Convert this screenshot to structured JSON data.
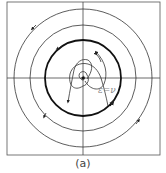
{
  "figure": {
    "caption": "(a)",
    "annotation": "ε=ν",
    "center": [
      83,
      78
    ],
    "frame": {
      "x": 7,
      "y": 2,
      "w": 153,
      "h": 153
    },
    "limit_cycle_radius": 38,
    "orbits": [
      {
        "radius": 53,
        "direction": "counterclockwise"
      },
      {
        "radius": 69,
        "direction": "counterclockwise"
      }
    ],
    "inner_spirals": "trajectories spiraling outward from unstable focus toward limit cycle",
    "colors": {
      "line": "#333333",
      "limit_cycle": "#111111",
      "background": "#ffffff"
    }
  }
}
